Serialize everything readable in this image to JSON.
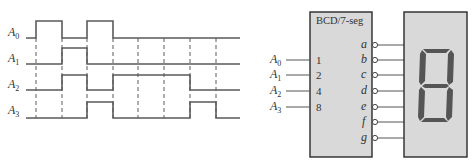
{
  "timing_diagram": {
    "signals": [
      {
        "name": "A",
        "sub": "0",
        "levels": [
          0,
          1,
          0,
          1,
          0,
          0,
          0,
          0,
          0
        ]
      },
      {
        "name": "A",
        "sub": "1",
        "levels": [
          0,
          0,
          1,
          0,
          0,
          0,
          0,
          0,
          0
        ]
      },
      {
        "name": "A",
        "sub": "2",
        "levels": [
          0,
          0,
          1,
          0,
          1,
          1,
          1,
          0,
          0
        ]
      },
      {
        "name": "A",
        "sub": "3",
        "levels": [
          0,
          0,
          0,
          1,
          0,
          0,
          0,
          1,
          0
        ]
      }
    ]
  },
  "decoder": {
    "title": "BCD/7-seg",
    "inputs": [
      {
        "label": "A",
        "sub": "0",
        "pin": "1"
      },
      {
        "label": "A",
        "sub": "1",
        "pin": "2"
      },
      {
        "label": "A",
        "sub": "2",
        "pin": "4"
      },
      {
        "label": "A",
        "sub": "3",
        "pin": "8"
      }
    ],
    "outputs": [
      "a",
      "b",
      "c",
      "d",
      "e",
      "f",
      "g"
    ]
  },
  "display": {
    "digit": "8",
    "segment_color": "#555555",
    "background_color": "#d9d9d9"
  }
}
